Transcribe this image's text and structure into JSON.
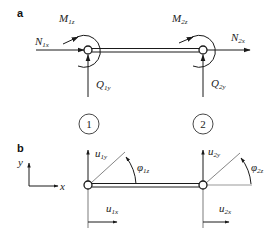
{
  "panels": {
    "a": {
      "label": "a",
      "forces": {
        "N1": {
          "main": "N",
          "sub": "1x"
        },
        "M1": {
          "main": "M",
          "sub": "1z"
        },
        "Q1": {
          "main": "Q",
          "sub": "1y"
        },
        "N2": {
          "main": "N",
          "sub": "2x"
        },
        "M2": {
          "main": "M",
          "sub": "2z"
        },
        "Q2": {
          "main": "Q",
          "sub": "2y"
        }
      },
      "nodes": [
        "1",
        "2"
      ]
    },
    "b": {
      "label": "b",
      "axes": {
        "x": "x",
        "y": "y"
      },
      "displacements": {
        "u1y": {
          "main": "u",
          "sub": "1y"
        },
        "u1x": {
          "main": "u",
          "sub": "1x"
        },
        "phi1": {
          "main": "φ",
          "sub": "1z"
        },
        "u2y": {
          "main": "u",
          "sub": "2y"
        },
        "u2x": {
          "main": "u",
          "sub": "2x"
        },
        "phi2": {
          "main": "φ",
          "sub": "2z"
        }
      }
    }
  },
  "colors": {
    "line": "#1a1a1a",
    "thin": "#444444"
  }
}
